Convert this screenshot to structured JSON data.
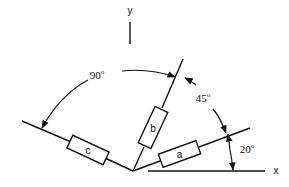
{
  "axes": {
    "x_label": "x",
    "y_label": "y"
  },
  "elements": [
    {
      "id": "a",
      "label": "a",
      "angle_deg": 20
    },
    {
      "id": "b",
      "label": "b",
      "angle_deg": 65
    },
    {
      "id": "c",
      "label": "c",
      "angle_deg": 155
    }
  ],
  "angles": [
    {
      "between": [
        "c",
        "b"
      ],
      "value": "90",
      "unit": "o"
    },
    {
      "between": [
        "b",
        "a"
      ],
      "value": "45",
      "unit": "o"
    },
    {
      "between": [
        "x",
        "a"
      ],
      "value": "20",
      "unit": "o"
    }
  ],
  "colors": {
    "stroke": "#111111",
    "background": "#ffffff"
  }
}
